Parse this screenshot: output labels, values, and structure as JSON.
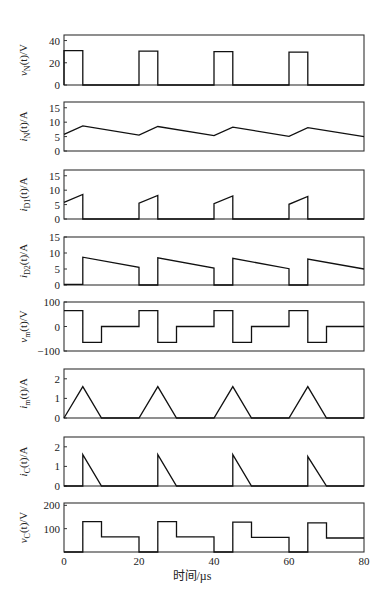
{
  "figure": {
    "xlabel": "时间/µs",
    "x_ticks": [
      "0",
      "20",
      "40",
      "60",
      "80"
    ]
  },
  "chart_data": [
    {
      "type": "line",
      "ylabel": "vN(t)/V",
      "ylabel_main": "v",
      "ylabel_sub": "N",
      "ylabel_rest": "(t)/V",
      "ylim": [
        0,
        45
      ],
      "yticks": [
        0,
        20,
        40
      ],
      "x": [
        0,
        0,
        5,
        5,
        20,
        20,
        25,
        25,
        40,
        40,
        45,
        45,
        60,
        60,
        65,
        65,
        80
      ],
      "y": [
        0,
        31,
        31,
        0,
        0,
        30.5,
        30.5,
        0,
        0,
        30,
        30,
        0,
        0,
        29.5,
        29.5,
        0,
        0
      ]
    },
    {
      "type": "line",
      "ylabel": "iN(t)/A",
      "ylabel_main": "i",
      "ylabel_sub": "N",
      "ylabel_rest": "(t)/A",
      "ylim": [
        0,
        17
      ],
      "yticks": [
        0,
        5,
        10,
        15
      ],
      "x": [
        0,
        5,
        20,
        25,
        40,
        45,
        60,
        65,
        80
      ],
      "y": [
        5.8,
        8.7,
        5.5,
        8.5,
        5.3,
        8.3,
        5.1,
        8.1,
        5.0
      ]
    },
    {
      "type": "line",
      "ylabel": "iD1(t)/A",
      "ylabel_main": "i",
      "ylabel_sub": "D1",
      "ylabel_rest": "(t)/A",
      "ylim": [
        0,
        17
      ],
      "yticks": [
        0,
        5,
        10,
        15
      ],
      "x": [
        0,
        5,
        5,
        20,
        20,
        25,
        25,
        40,
        40,
        45,
        45,
        60,
        60,
        65,
        65,
        80
      ],
      "y": [
        5.8,
        8.5,
        0,
        0,
        5.5,
        8.2,
        0,
        0,
        5.3,
        8.0,
        0,
        0,
        5.1,
        7.8,
        0,
        0
      ]
    },
    {
      "type": "line",
      "ylabel": "iD2(t)/A",
      "ylabel_main": "i",
      "ylabel_sub": "D2",
      "ylabel_rest": "(t)/A",
      "ylim": [
        0,
        15
      ],
      "yticks": [
        0,
        5,
        10,
        15
      ],
      "x": [
        0,
        5,
        5,
        20,
        20,
        25,
        25,
        40,
        40,
        45,
        45,
        60,
        60,
        65,
        65,
        80
      ],
      "y": [
        0.2,
        0.2,
        8.7,
        5.5,
        0,
        0,
        8.5,
        5.3,
        0,
        0,
        8.3,
        5.1,
        0,
        0,
        8.1,
        5.0
      ]
    },
    {
      "type": "line",
      "ylabel": "vm(t)/V",
      "ylabel_main": "v",
      "ylabel_sub": "m",
      "ylabel_rest": "(t)/V",
      "ylim": [
        -100,
        100
      ],
      "yticks": [
        -100,
        0,
        100
      ],
      "x": [
        0,
        5,
        5,
        10,
        10,
        20,
        20,
        25,
        25,
        30,
        30,
        40,
        40,
        45,
        45,
        50,
        50,
        60,
        60,
        65,
        65,
        70,
        70,
        80
      ],
      "y": [
        65,
        65,
        -65,
        -65,
        0,
        0,
        65,
        65,
        -65,
        -65,
        0,
        0,
        65,
        65,
        -65,
        -65,
        0,
        0,
        65,
        65,
        -65,
        -65,
        0,
        0
      ]
    },
    {
      "type": "line",
      "ylabel": "im(t)/A",
      "ylabel_main": "i",
      "ylabel_sub": "m",
      "ylabel_rest": "(t)/A",
      "ylim": [
        0,
        2.5
      ],
      "yticks": [
        0,
        1,
        2
      ],
      "x": [
        0,
        5,
        10,
        20,
        25,
        30,
        40,
        45,
        50,
        60,
        65,
        70,
        80
      ],
      "y": [
        0,
        1.6,
        0,
        0,
        1.6,
        0,
        0,
        1.6,
        0,
        0,
        1.6,
        0,
        0
      ]
    },
    {
      "type": "line",
      "ylabel": "iC(t)/A",
      "ylabel_main": "i",
      "ylabel_sub": "C",
      "ylabel_rest": "(t)/A",
      "ylim": [
        0,
        2.5
      ],
      "yticks": [
        0,
        1,
        2
      ],
      "x": [
        0,
        5,
        5,
        10,
        25,
        25,
        30,
        45,
        45,
        50,
        65,
        65,
        70,
        80
      ],
      "y": [
        0,
        0,
        1.6,
        0,
        0,
        1.6,
        0,
        0,
        1.6,
        0,
        0,
        1.5,
        0,
        0
      ]
    },
    {
      "type": "line",
      "ylabel": "vC(t)/V",
      "ylabel_main": "v",
      "ylabel_sub": "C",
      "ylabel_rest": "(t)/V",
      "ylim": [
        0,
        210
      ],
      "yticks": [
        100,
        200
      ],
      "x": [
        0,
        5,
        5,
        10,
        10,
        20,
        20,
        25,
        25,
        30,
        30,
        40,
        40,
        45,
        45,
        50,
        50,
        60,
        60,
        65,
        65,
        70,
        70,
        80
      ],
      "y": [
        0,
        0,
        130,
        130,
        65,
        65,
        0,
        0,
        130,
        130,
        65,
        65,
        0,
        0,
        128,
        128,
        63,
        63,
        0,
        0,
        125,
        125,
        60,
        60
      ]
    }
  ]
}
